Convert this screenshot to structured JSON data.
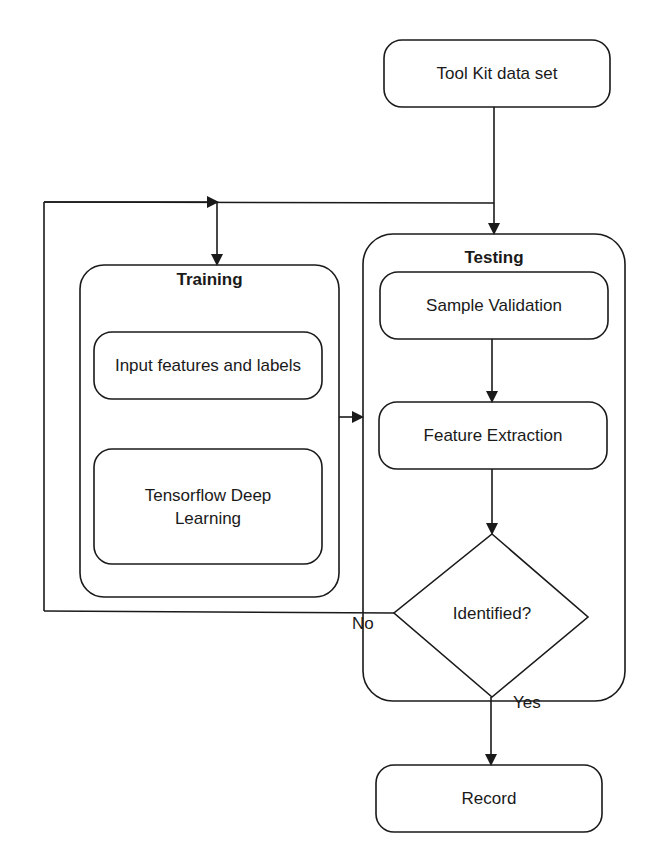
{
  "diagram": {
    "type": "flowchart",
    "nodes": {
      "toolkit": {
        "label": "Tool Kit data set",
        "shape": "rounded-rect"
      },
      "training": {
        "title": "Training",
        "shape": "rounded-container",
        "children": {
          "input_features": {
            "label": "Input features and labels"
          },
          "tensorflow": {
            "label": "Tensorflow Deep Learning"
          }
        }
      },
      "testing": {
        "title": "Testing",
        "shape": "rounded-container",
        "children": {
          "sample_validation": {
            "label": "Sample Validation"
          },
          "feature_extraction": {
            "label": "Feature Extraction"
          },
          "identified": {
            "label": "Identified?",
            "shape": "diamond"
          }
        }
      },
      "record": {
        "label": "Record",
        "shape": "rounded-rect"
      }
    },
    "edges": [
      {
        "from": "Tool Kit data set",
        "to": "Testing"
      },
      {
        "from": "Tool Kit data set",
        "to": "Training"
      },
      {
        "from": "Training",
        "to": "Testing"
      },
      {
        "from": "Sample Validation",
        "to": "Feature Extraction"
      },
      {
        "from": "Feature Extraction",
        "to": "Identified?"
      },
      {
        "from": "Identified?",
        "to": "Training",
        "label": "No"
      },
      {
        "from": "Identified?",
        "to": "Record",
        "label": "Yes"
      }
    ],
    "edge_labels": {
      "no": "No",
      "yes": "Yes"
    },
    "colors": {
      "stroke": "#1a1a1a",
      "background": "#ffffff"
    }
  }
}
